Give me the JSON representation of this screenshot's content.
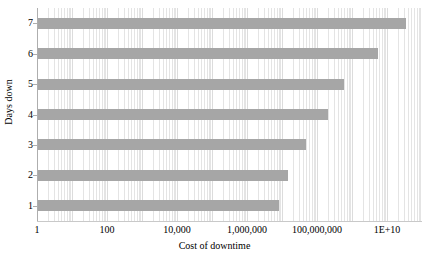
{
  "chart_data": {
    "type": "bar",
    "orientation": "horizontal",
    "title": "",
    "xlabel": "Cost of downtime",
    "ylabel": "Days down",
    "xscale": "log",
    "xlim": [
      1,
      100000000000
    ],
    "grid": true,
    "legend": false,
    "bar_color": "#a6a6a6",
    "categories": [
      "1",
      "2",
      "3",
      "4",
      "5",
      "6",
      "7"
    ],
    "values": [
      8000000,
      15000000,
      50000000,
      200000000,
      600000000,
      5600000000,
      36000000000
    ],
    "x_tick_labels": [
      "1",
      "100",
      "10,000",
      "1,000,000",
      "100,000,000",
      "1E+10"
    ],
    "x_tick_values": [
      1,
      100,
      10000,
      1000000,
      100000000,
      10000000000
    ],
    "y_tick_labels": [
      "1",
      "2",
      "3",
      "4",
      "5",
      "6",
      "7"
    ]
  },
  "axes": {
    "x_title": "Cost of downtime",
    "y_title": "Days down"
  }
}
